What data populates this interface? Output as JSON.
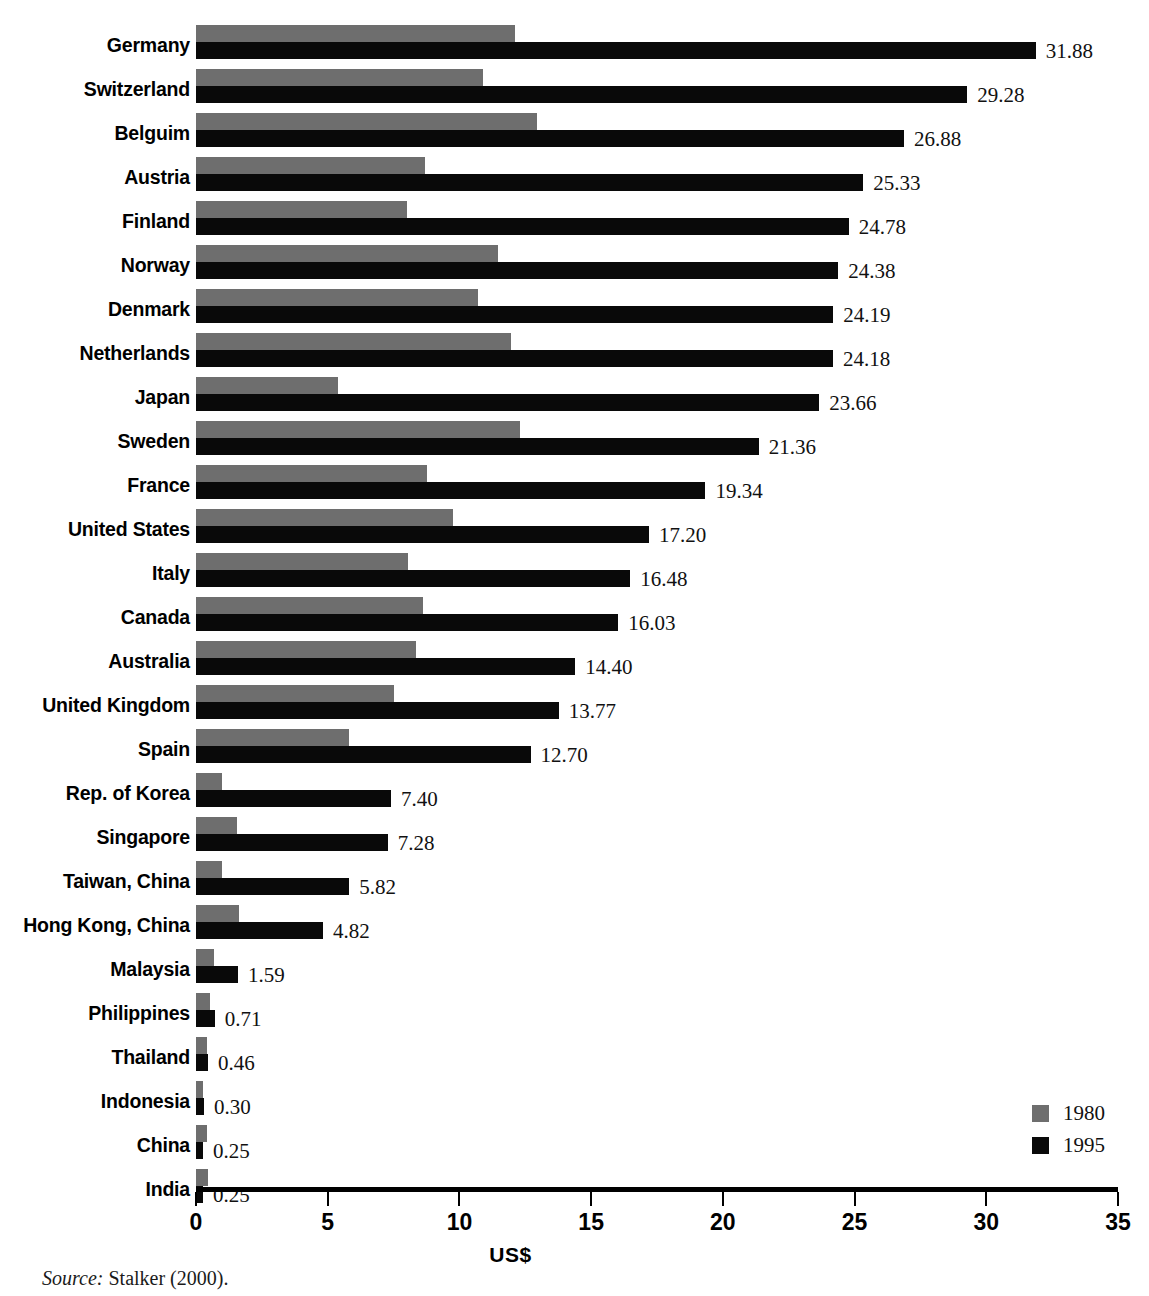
{
  "chart_data": {
    "type": "bar",
    "orientation": "horizontal",
    "title": "",
    "xlabel": "US$",
    "ylabel": "",
    "xlim": [
      0,
      35
    ],
    "xticks": [
      "0",
      "5",
      "10",
      "15",
      "20",
      "25",
      "30",
      "35"
    ],
    "xtick_values": [
      0,
      5,
      10,
      15,
      20,
      25,
      30,
      35
    ],
    "grid": false,
    "legend_position": "bottom-right",
    "categories": [
      "Germany",
      "Switzerland",
      "Belguim",
      "Austria",
      "Finland",
      "Norway",
      "Denmark",
      "Netherlands",
      "Japan",
      "Sweden",
      "France",
      "United States",
      "Italy",
      "Canada",
      "Australia",
      "United Kingdom",
      "Spain",
      "Rep. of Korea",
      "Singapore",
      "Taiwan, China",
      "Hong Kong, China",
      "Malaysia",
      "Philippines",
      "Thailand",
      "Indonesia",
      "China",
      "India"
    ],
    "series": [
      {
        "name": "1980",
        "color": "#6e6e6e",
        "values": [
          12.1,
          10.9,
          12.95,
          8.7,
          8.0,
          11.45,
          10.7,
          11.95,
          5.4,
          12.3,
          8.75,
          9.75,
          8.05,
          8.6,
          8.35,
          7.5,
          5.8,
          1.0,
          1.55,
          1.0,
          1.65,
          0.7,
          0.55,
          0.4,
          0.28,
          0.4,
          0.45
        ]
      },
      {
        "name": "1995",
        "color": "#090909",
        "values": [
          31.88,
          29.28,
          26.88,
          25.33,
          24.78,
          24.38,
          24.19,
          24.18,
          23.66,
          21.36,
          19.34,
          17.2,
          16.48,
          16.03,
          14.4,
          13.77,
          12.7,
          7.4,
          7.28,
          5.82,
          4.82,
          1.59,
          0.71,
          0.46,
          0.3,
          0.25,
          0.25
        ]
      }
    ],
    "value_labels": [
      "31.88",
      "29.28",
      "26.88",
      "25.33",
      "24.78",
      "24.38",
      "24.19",
      "24.18",
      "23.66",
      "21.36",
      "19.34",
      "17.20",
      "16.48",
      "16.03",
      "14.40",
      "13.77",
      "12.70",
      "7.40",
      "7.28",
      "5.82",
      "4.82",
      "1.59",
      "0.71",
      "0.46",
      "0.30",
      "0.25",
      "0.25"
    ]
  },
  "legend": {
    "items": [
      {
        "label": "1980",
        "color": "#6e6e6e"
      },
      {
        "label": "1995",
        "color": "#090909"
      }
    ]
  },
  "axis": {
    "x_title": "US$"
  },
  "source": {
    "prefix": "Source:",
    "text": "Stalker (2000)."
  },
  "title_sliver": {
    "text": ""
  },
  "colors": {
    "series_1980": "#6e6e6e",
    "series_1995": "#090909",
    "background": "#ffffff",
    "text": "#000000"
  }
}
